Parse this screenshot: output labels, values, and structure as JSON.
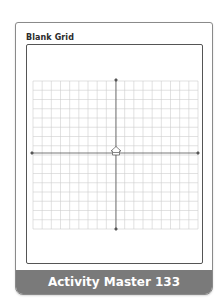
{
  "title": "Blank Grid",
  "footer": "Activity Master 133",
  "grid": {
    "columns": 18,
    "rows": 16,
    "x_axis": true,
    "y_axis": true,
    "origin_icon": "home-icon",
    "line_color": "#c8c8c8",
    "axis_color": "#555555"
  },
  "colors": {
    "footer_bg": "#7a7a7a",
    "border": "#8a8a8a"
  }
}
